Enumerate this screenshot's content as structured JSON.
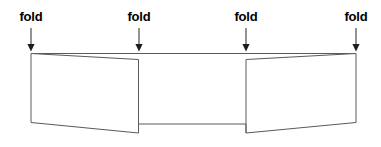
{
  "diagram": {
    "type": "folding-diagram",
    "canvas": {
      "width": 381,
      "height": 147,
      "background": "#ffffff"
    },
    "colors": {
      "label_text": "#000000",
      "arrow": "#2b2b2b",
      "outline": "#555555",
      "top_edge": "#555555",
      "panel_fill": "#ffffff"
    },
    "labels": [
      {
        "id": "fold-1",
        "text": "fold",
        "x": 31,
        "y": 10
      },
      {
        "id": "fold-2",
        "text": "fold",
        "x": 139,
        "y": 10
      },
      {
        "id": "fold-3",
        "text": "fold",
        "x": 246,
        "y": 10
      },
      {
        "id": "fold-4",
        "text": "fold",
        "x": 356,
        "y": 10
      }
    ],
    "arrows": [
      {
        "id": "arrow-1",
        "x": 31,
        "y_start": 28,
        "y_end": 51
      },
      {
        "id": "arrow-2",
        "x": 139,
        "y_start": 28,
        "y_end": 51
      },
      {
        "id": "arrow-3",
        "x": 246,
        "y_start": 28,
        "y_end": 51
      },
      {
        "id": "arrow-4",
        "x": 356,
        "y_start": 28,
        "y_end": 51
      }
    ],
    "shapes": {
      "top_edge": {
        "x1": 31,
        "y1": 53.5,
        "x2": 356,
        "y2": 53.5
      },
      "left_panel": [
        [
          31,
          53.5
        ],
        [
          138.5,
          59.5
        ],
        [
          138.5,
          133
        ],
        [
          31,
          122.5
        ]
      ],
      "right_panel": [
        [
          246,
          59.5
        ],
        [
          356,
          53.5
        ],
        [
          356,
          122.5
        ],
        [
          246,
          133
        ]
      ],
      "spine": {
        "x1": 138.5,
        "y1": 124,
        "x2": 246,
        "y2": 124
      }
    }
  }
}
